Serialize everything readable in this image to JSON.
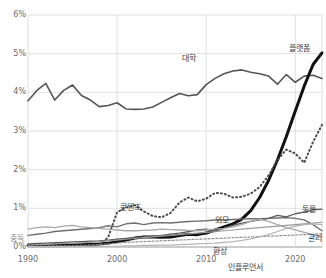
{
  "chart_data": {
    "type": "line",
    "title": "",
    "xlabel": "",
    "ylabel": "",
    "xlim": [
      1990,
      2023
    ],
    "ylim": [
      0,
      6
    ],
    "grid": true,
    "legend_position": "inline-labels",
    "ytick_labels": [
      "0%",
      "1%",
      "2%",
      "3%",
      "4%",
      "5%",
      "6%"
    ],
    "ytick_values": [
      0,
      1,
      2,
      3,
      4,
      5,
      6
    ],
    "xtick_labels": [
      "1990",
      "2000",
      "2010",
      "2020"
    ],
    "xtick_values": [
      1990,
      2000,
      2010,
      2020
    ],
    "series": [
      {
        "name": "대학",
        "label": "대학",
        "color": "#555555",
        "width": 1.6,
        "dash": "none",
        "x": [
          1990,
          1991,
          1992,
          1993,
          1994,
          1995,
          1996,
          1997,
          1998,
          1999,
          2000,
          2001,
          2002,
          2003,
          2004,
          2005,
          2006,
          2007,
          2008,
          2009,
          2010,
          2011,
          2012,
          2013,
          2014,
          2015,
          2016,
          2017,
          2018,
          2019,
          2020,
          2021,
          2022,
          2023
        ],
        "values": [
          3.78,
          4.05,
          4.23,
          3.8,
          4.05,
          4.19,
          3.92,
          3.8,
          3.63,
          3.66,
          3.73,
          3.57,
          3.56,
          3.57,
          3.62,
          3.74,
          3.86,
          3.97,
          3.91,
          3.94,
          4.2,
          4.36,
          4.48,
          4.55,
          4.58,
          4.52,
          4.48,
          4.42,
          4.21,
          4.46,
          4.26,
          4.42,
          4.44,
          4.36
        ]
      },
      {
        "name": "플랫폼",
        "label": "플랫폼",
        "color": "#111111",
        "width": 3.0,
        "dash": "none",
        "x": [
          1990,
          1991,
          1992,
          1993,
          1994,
          1995,
          1996,
          1997,
          1998,
          1999,
          2000,
          2001,
          2002,
          2003,
          2004,
          2005,
          2006,
          2007,
          2008,
          2009,
          2010,
          2011,
          2012,
          2013,
          2014,
          2015,
          2016,
          2017,
          2018,
          2019,
          2020,
          2021,
          2022,
          2023
        ],
        "values": [
          0.04,
          0.04,
          0.04,
          0.05,
          0.05,
          0.05,
          0.06,
          0.07,
          0.08,
          0.1,
          0.14,
          0.18,
          0.23,
          0.26,
          0.26,
          0.25,
          0.26,
          0.3,
          0.33,
          0.32,
          0.36,
          0.44,
          0.52,
          0.6,
          0.72,
          0.94,
          1.28,
          1.72,
          2.25,
          2.86,
          3.52,
          4.16,
          4.72,
          5.02
        ]
      },
      {
        "name": "콘텐츠",
        "label": "콘텐츠",
        "color": "#4a4a4a",
        "width": 2.0,
        "dash": "1,3",
        "x": [
          1990,
          1991,
          1992,
          1993,
          1994,
          1995,
          1996,
          1997,
          1998,
          1999,
          2000,
          2001,
          2002,
          2003,
          2004,
          2005,
          2006,
          2007,
          2008,
          2009,
          2010,
          2011,
          2012,
          2013,
          2014,
          2015,
          2016,
          2017,
          2018,
          2019,
          2020,
          2021,
          2022,
          2023
        ],
        "values": [
          0.02,
          0.02,
          0.02,
          0.02,
          0.02,
          0.03,
          0.03,
          0.04,
          0.06,
          0.25,
          0.9,
          1.02,
          1.08,
          0.92,
          0.8,
          0.77,
          0.88,
          1.15,
          1.28,
          1.18,
          1.25,
          1.4,
          1.38,
          1.28,
          1.3,
          1.38,
          1.55,
          1.85,
          2.25,
          2.52,
          2.42,
          2.18,
          2.72,
          3.16
        ]
      },
      {
        "name": "외모",
        "label": "외모",
        "color": "#6f6f6f",
        "width": 1.4,
        "dash": "none",
        "x": [
          1990,
          1991,
          1992,
          1993,
          1994,
          1995,
          1996,
          1997,
          1998,
          1999,
          2000,
          2001,
          2002,
          2003,
          2004,
          2005,
          2006,
          2007,
          2008,
          2009,
          2010,
          2011,
          2012,
          2013,
          2014,
          2015,
          2016,
          2017,
          2018,
          2019,
          2020,
          2021,
          2022,
          2023
        ],
        "values": [
          0.3,
          0.33,
          0.36,
          0.4,
          0.42,
          0.44,
          0.46,
          0.48,
          0.5,
          0.55,
          0.52,
          0.6,
          0.62,
          0.58,
          0.62,
          0.63,
          0.62,
          0.64,
          0.66,
          0.67,
          0.68,
          0.7,
          0.7,
          0.71,
          0.72,
          0.73,
          0.73,
          0.74,
          0.75,
          0.76,
          0.74,
          0.7,
          0.58,
          0.42
        ]
      },
      {
        "name": "동물",
        "label": "동물",
        "color": "#5a5a5a",
        "width": 1.3,
        "dash": "none",
        "x": [
          1990,
          1991,
          1992,
          1993,
          1994,
          1995,
          1996,
          1997,
          1998,
          1999,
          2000,
          2001,
          2002,
          2003,
          2004,
          2005,
          2006,
          2007,
          2008,
          2009,
          2010,
          2011,
          2012,
          2013,
          2014,
          2015,
          2016,
          2017,
          2018,
          2019,
          2020,
          2021,
          2022,
          2023
        ],
        "values": [
          0.08,
          0.09,
          0.1,
          0.11,
          0.12,
          0.13,
          0.14,
          0.15,
          0.16,
          0.18,
          0.2,
          0.22,
          0.24,
          0.26,
          0.28,
          0.3,
          0.33,
          0.36,
          0.4,
          0.44,
          0.46,
          0.42,
          0.48,
          0.56,
          0.62,
          0.66,
          0.7,
          0.74,
          0.82,
          0.78,
          0.86,
          0.9,
          0.96,
          0.98
        ]
      },
      {
        "name": "중독",
        "label": "중독",
        "color": "#a9a9a9",
        "width": 1.3,
        "dash": "none",
        "x": [
          1990,
          1991,
          1992,
          1993,
          1994,
          1995,
          1996,
          1997,
          1998,
          1999,
          2000,
          2001,
          2002,
          2003,
          2004,
          2005,
          2006,
          2007,
          2008,
          2009,
          2010,
          2011,
          2012,
          2013,
          2014,
          2015,
          2016,
          2017,
          2018,
          2019,
          2020,
          2021,
          2022,
          2023
        ],
        "values": [
          0.46,
          0.5,
          0.52,
          0.5,
          0.54,
          0.56,
          0.52,
          0.5,
          0.48,
          0.46,
          0.44,
          0.42,
          0.42,
          0.43,
          0.44,
          0.46,
          0.45,
          0.44,
          0.43,
          0.42,
          0.44,
          0.46,
          0.48,
          0.52,
          0.58,
          0.66,
          0.72,
          0.66,
          0.58,
          0.5,
          0.44,
          0.38,
          0.32,
          0.26
        ]
      },
      {
        "name": "관리",
        "label": "관리",
        "color": "#9b9b9b",
        "width": 1.2,
        "dash": "none",
        "x": [
          1990,
          1991,
          1992,
          1993,
          1994,
          1995,
          1996,
          1997,
          1998,
          1999,
          2000,
          2001,
          2002,
          2003,
          2004,
          2005,
          2006,
          2007,
          2008,
          2009,
          2010,
          2011,
          2012,
          2013,
          2014,
          2015,
          2016,
          2017,
          2018,
          2019,
          2020,
          2021,
          2022,
          2023
        ],
        "values": [
          0.05,
          0.06,
          0.07,
          0.08,
          0.09,
          0.1,
          0.11,
          0.12,
          0.14,
          0.16,
          0.18,
          0.2,
          0.22,
          0.24,
          0.26,
          0.28,
          0.3,
          0.32,
          0.34,
          0.36,
          0.38,
          0.4,
          0.42,
          0.44,
          0.46,
          0.48,
          0.5,
          0.52,
          0.54,
          0.56,
          0.58,
          0.6,
          0.62,
          0.64
        ]
      },
      {
        "name": "환상",
        "label": "환상",
        "color": "#8e8e8e",
        "width": 1.2,
        "dash": "2,2",
        "x": [
          1990,
          1991,
          1992,
          1993,
          1994,
          1995,
          1996,
          1997,
          1998,
          1999,
          2000,
          2001,
          2002,
          2003,
          2004,
          2005,
          2006,
          2007,
          2008,
          2009,
          2010,
          2011,
          2012,
          2013,
          2014,
          2015,
          2016,
          2017,
          2018,
          2019,
          2020,
          2021,
          2022,
          2023
        ],
        "values": [
          0.02,
          0.02,
          0.02,
          0.03,
          0.03,
          0.03,
          0.04,
          0.05,
          0.06,
          0.08,
          0.1,
          0.12,
          0.13,
          0.14,
          0.15,
          0.16,
          0.17,
          0.18,
          0.19,
          0.2,
          0.21,
          0.22,
          0.23,
          0.24,
          0.25,
          0.26,
          0.27,
          0.28,
          0.29,
          0.3,
          0.31,
          0.32,
          0.33,
          0.34
        ]
      },
      {
        "name": "인플루언서",
        "label": "인플루언서",
        "color": "#b5b5b5",
        "width": 1.2,
        "dash": "none",
        "x": [
          1990,
          1991,
          1992,
          1993,
          1994,
          1995,
          1996,
          1997,
          1998,
          1999,
          2000,
          2001,
          2002,
          2003,
          2004,
          2005,
          2006,
          2007,
          2008,
          2009,
          2010,
          2011,
          2012,
          2013,
          2014,
          2015,
          2016,
          2017,
          2018,
          2019,
          2020,
          2021,
          2022,
          2023
        ],
        "values": [
          0.01,
          0.01,
          0.01,
          0.01,
          0.01,
          0.01,
          0.01,
          0.01,
          0.02,
          0.02,
          0.02,
          0.03,
          0.03,
          0.04,
          0.04,
          0.05,
          0.05,
          0.06,
          0.07,
          0.08,
          0.09,
          0.1,
          0.12,
          0.14,
          0.17,
          0.21,
          0.26,
          0.32,
          0.4,
          0.48,
          0.54,
          0.58,
          0.6,
          0.58
        ]
      }
    ],
    "inline_labels": [
      {
        "text": "대학",
        "x_px": 182,
        "y_px": 52,
        "tone": "dark"
      },
      {
        "text": "플랫폼",
        "x_px": 289,
        "y_px": 42,
        "tone": "dark"
      },
      {
        "text": "콘텐츠",
        "x_px": 120,
        "y_px": 201,
        "tone": "dark"
      },
      {
        "text": "외모",
        "x_px": 215,
        "y_px": 214,
        "tone": "dark"
      },
      {
        "text": "동물",
        "x_px": 302,
        "y_px": 203,
        "tone": "dark"
      },
      {
        "text": "관리",
        "x_px": 308,
        "y_px": 232,
        "tone": "dark"
      },
      {
        "text": "중독",
        "x_px": 10,
        "y_px": 232,
        "tone": "light"
      },
      {
        "text": "환상",
        "x_px": 213,
        "y_px": 245,
        "tone": "dark"
      },
      {
        "text": "인플루언서",
        "x_px": 228,
        "y_px": 261,
        "tone": "dark"
      }
    ]
  }
}
